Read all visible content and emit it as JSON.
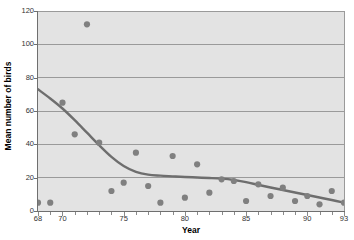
{
  "chart_data": {
    "type": "scatter",
    "title": "",
    "xlabel": "Year",
    "ylabel": "Mean number of birds",
    "xlim": [
      68,
      93
    ],
    "ylim": [
      0,
      120
    ],
    "grid": true,
    "grid_axis": "y",
    "legend": false,
    "x_ticks_labeled": [
      68,
      70,
      75,
      80,
      85,
      90,
      93
    ],
    "y_ticks_labeled": [
      0,
      20,
      40,
      60,
      80,
      100,
      120
    ],
    "x_tick_step_minor": 1,
    "series": [
      {
        "name": "Mean number of birds",
        "type": "scatter",
        "marker": "circle",
        "color": "#808080",
        "x": [
          68,
          69,
          70,
          71,
          72,
          73,
          74,
          75,
          76,
          77,
          78,
          79,
          80,
          81,
          82,
          83,
          84,
          85,
          86,
          87,
          88,
          89,
          90,
          91,
          92,
          93
        ],
        "values": [
          5,
          5,
          65,
          46,
          112,
          41,
          12,
          17,
          35,
          15,
          5,
          33,
          8,
          28,
          11,
          19,
          18,
          6,
          16,
          9,
          14,
          6,
          9,
          4,
          12,
          5
        ]
      },
      {
        "name": "Trend line",
        "type": "line",
        "color": "#6e6e6e",
        "x": [
          68,
          69,
          70,
          71,
          72,
          73,
          74,
          75,
          76,
          77,
          78,
          79,
          80,
          81,
          82,
          83,
          84,
          85,
          86,
          87,
          88,
          89,
          90,
          91,
          92,
          93
        ],
        "values": [
          73,
          67.5,
          61.5,
          54.5,
          47,
          39.5,
          32.5,
          27,
          23.5,
          21.8,
          21.2,
          20.8,
          20.4,
          20.1,
          19.8,
          19.4,
          18.6,
          17.3,
          15.7,
          14.1,
          12.6,
          11.1,
          9.6,
          8.1,
          6.6,
          5.0
        ]
      }
    ]
  },
  "axes": {
    "y_title": "Mean number of birds",
    "x_title": "Year",
    "y_tick_labels": [
      "120",
      "100",
      "80",
      "60",
      "40",
      "20",
      "0"
    ],
    "x_tick_labels": [
      "68",
      "70",
      "75",
      "80",
      "85",
      "90",
      "93"
    ]
  },
  "colors": {
    "plot_background": "#e3e3e3",
    "page_background": "#ffffff",
    "gridline": "#9a9a9a",
    "axis": "#6f6f6f",
    "marker": "#808080",
    "trend_line": "#6e6e6e",
    "text": "#333333"
  }
}
